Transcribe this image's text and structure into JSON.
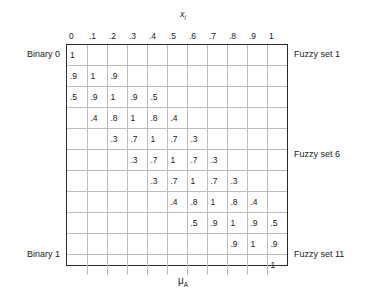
{
  "figure": {
    "top_axis": {
      "symbol": "x",
      "subscript": "i"
    },
    "bottom_axis": {
      "symbol": "μ",
      "subscript": "A"
    },
    "column_headers": [
      "0",
      ".1",
      ".2",
      ".3",
      ".4",
      ".5",
      ".6",
      ".7",
      ".8",
      ".9",
      "1"
    ],
    "left_labels": [
      {
        "row": 1,
        "text": "Binary 0"
      },
      {
        "row": 11,
        "text": "Binary 1"
      }
    ],
    "right_labels": [
      {
        "row": 1,
        "text": "Fuzzy set 1"
      },
      {
        "row": 6,
        "text": "Fuzzy set 6"
      },
      {
        "row": 11,
        "text": "Fuzzy set 11"
      }
    ],
    "colors": {
      "border": "#2b2b2b",
      "gridline": "#bcbcbc",
      "text": "#1a1a1a",
      "background": "#ffffff"
    }
  },
  "chart_data": {
    "type": "heatmap",
    "title": "",
    "xlabel": "x_i",
    "ylabel": "mu_A",
    "grid": true,
    "legend_position": "right",
    "rows": 11,
    "columns": 11,
    "x": [
      "0",
      ".1",
      ".2",
      ".3",
      ".4",
      ".5",
      ".6",
      ".7",
      ".8",
      ".9",
      "1"
    ],
    "row_labels": [
      "Fuzzy set 1",
      "Fuzzy set 2",
      "Fuzzy set 3",
      "Fuzzy set 4",
      "Fuzzy set 5",
      "Fuzzy set 6",
      "Fuzzy set 7",
      "Fuzzy set 8",
      "Fuzzy set 9",
      "Fuzzy set 10",
      "Fuzzy set 11"
    ],
    "annotations": [
      "Binary 0",
      "Binary 1",
      "Fuzzy set 1",
      "Fuzzy set 6",
      "Fuzzy set 11"
    ],
    "values": [
      [
        "1",
        "",
        "",
        "",
        "",
        "",
        "",
        "",
        "",
        "",
        ""
      ],
      [
        ".9",
        "1",
        ".9",
        "",
        "",
        "",
        "",
        "",
        "",
        "",
        ""
      ],
      [
        ".5",
        ".9",
        "1",
        ".9",
        ".5",
        "",
        "",
        "",
        "",
        "",
        ""
      ],
      [
        "",
        ".4",
        ".8",
        "1",
        ".8",
        ".4",
        "",
        "",
        "",
        "",
        ""
      ],
      [
        "",
        "",
        ".3",
        ".7",
        "1",
        ".7",
        ".3",
        "",
        "",
        "",
        ""
      ],
      [
        "",
        "",
        "",
        ".3",
        ".7",
        "1",
        ".7",
        ".3",
        "",
        "",
        ""
      ],
      [
        "",
        "",
        "",
        "",
        ".3",
        ".7",
        "1",
        ".7",
        ".3",
        "",
        ""
      ],
      [
        "",
        "",
        "",
        "",
        "",
        ".4",
        ".8",
        "1",
        ".8",
        ".4",
        ""
      ],
      [
        "",
        "",
        "",
        "",
        "",
        "",
        ".5",
        ".9",
        "1",
        ".9",
        ".5"
      ],
      [
        "",
        "",
        "",
        "",
        "",
        "",
        "",
        "",
        ".9",
        "1",
        ".9"
      ],
      [
        "",
        "",
        "",
        "",
        "",
        "",
        "",
        "",
        "",
        "",
        "1"
      ]
    ]
  }
}
